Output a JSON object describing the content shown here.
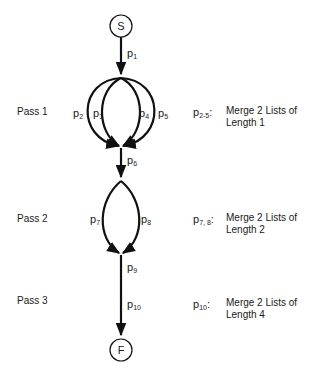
{
  "nodes": {
    "start": {
      "label": "S"
    },
    "finish": {
      "label": "F"
    }
  },
  "edges": {
    "p1": {
      "base": "p",
      "sub": "1"
    },
    "p2": {
      "base": "p",
      "sub": "2"
    },
    "p3": {
      "base": "p",
      "sub": "3"
    },
    "p4": {
      "base": "p",
      "sub": "4"
    },
    "p5": {
      "base": "p",
      "sub": "5"
    },
    "p6": {
      "base": "p",
      "sub": "6"
    },
    "p7": {
      "base": "p",
      "sub": "7"
    },
    "p8": {
      "base": "p",
      "sub": "8"
    },
    "p9": {
      "base": "p",
      "sub": "9"
    },
    "p10": {
      "base": "p",
      "sub": "10"
    }
  },
  "passes": [
    {
      "label": "Pass 1",
      "key_base": "p",
      "key_sub": "2-5",
      "key_colon": ":",
      "desc_line1": "Merge 2 Lists of",
      "desc_line2": "Length 1"
    },
    {
      "label": "Pass 2",
      "key_base": "p",
      "key_sub": "7, 8",
      "key_colon": ":",
      "desc_line1": "Merge 2 Lists of",
      "desc_line2": "Length 2"
    },
    {
      "label": "Pass 3",
      "key_base": "p",
      "key_sub": "10",
      "key_colon": ":",
      "desc_line1": "Merge 2 Lists of",
      "desc_line2": "Length 4"
    }
  ],
  "colors": {
    "stroke": "#111111",
    "text": "#1a1a1a",
    "background": "#ffffff"
  }
}
